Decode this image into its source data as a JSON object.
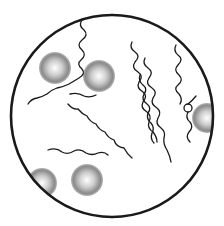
{
  "illustration": {
    "subject": "microscope field view with spiral bacteria and round cells",
    "colors": {
      "ink": "#1a1a1a",
      "background": "#ffffff",
      "stipple": "#555555"
    },
    "field": {
      "cx": 112,
      "cy": 116,
      "r": 102
    },
    "cells": [
      {
        "cx": 55,
        "cy": 60,
        "r": 16
      },
      {
        "cx": 98,
        "cy": 75,
        "r": 16
      },
      {
        "cx": 42,
        "cy": 183,
        "r": 14
      },
      {
        "cx": 85,
        "cy": 180,
        "r": 16
      },
      {
        "cx": 205,
        "cy": 118,
        "r": 15
      }
    ]
  }
}
